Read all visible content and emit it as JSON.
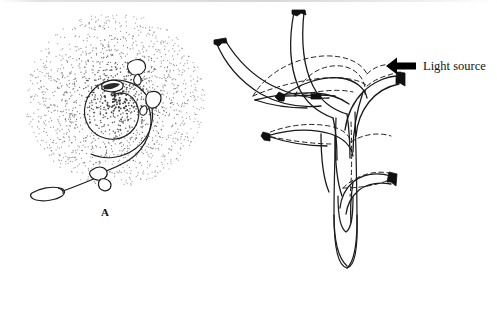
{
  "figure": {
    "type": "scientific-line-drawing",
    "background_color": "#ffffff",
    "ink_color": "#1a1a1a",
    "stipple_color": "#3a3a3a",
    "width": 497,
    "height": 320
  },
  "panels": [
    {
      "id": "A",
      "label": "A",
      "caption_position": "below-center",
      "view": "apical-top-view",
      "description": "Shoot apex viewed from above with stippled radial shading and a generative spiral bearing leaf primordia",
      "spiral": {
        "turns": 1.9,
        "center_x": 115,
        "center_y": 100,
        "direction": "counterclockwise-outward"
      },
      "stipple": {
        "center_x": 115,
        "center_y": 100,
        "outer_radius": 88,
        "core_radius": 13,
        "dot_count": 2600,
        "densest_at": "center"
      },
      "primordia_count": 5
    },
    {
      "id": "B",
      "label": "B",
      "caption_position": "below-center",
      "view": "lateral-side-view",
      "description": "Seedling shoot with leaves shown in original (dashed) and phototropically bent (solid) positions, curving toward the light",
      "stem": {
        "base_shape": "rounded-cylinder-coleoptile",
        "orientation": "vertical"
      },
      "leaves": [
        {
          "name": "upper-left-leaf",
          "state_original": "dashed",
          "state_bent": "solid"
        },
        {
          "name": "upper-center-leaf",
          "state_original": "dashed",
          "state_bent": "solid"
        },
        {
          "name": "upper-right-leaf",
          "state_original": "dashed",
          "state_bent": "solid"
        },
        {
          "name": "mid-left-leaf",
          "state_original": "dashed",
          "state_bent": "solid"
        },
        {
          "name": "lower-right-leaf",
          "state_original": "dashed",
          "state_bent": "solid"
        }
      ]
    }
  ],
  "annotation": {
    "light_source": {
      "text": "Light source",
      "arrow_direction": "left",
      "arrow_color": "#000000",
      "meaning": "Direction of incident light; leaves bend toward it"
    }
  },
  "legend": {
    "solid_line_meaning": "Leaf position after phototropic bending",
    "dashed_line_meaning": "Original leaf position before bending"
  }
}
